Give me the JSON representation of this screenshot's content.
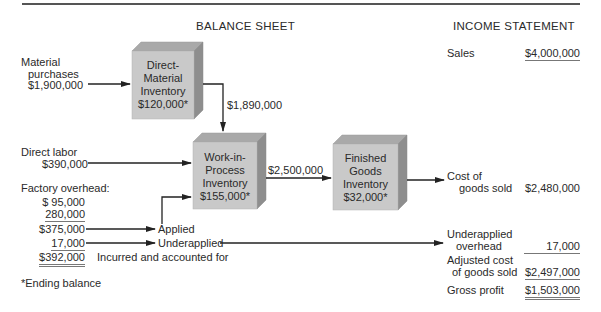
{
  "headers": {
    "balance_sheet": "BALANCE SHEET",
    "income_statement": "INCOME STATEMENT"
  },
  "inputs": {
    "material_purchases_label_1": "Material",
    "material_purchases_label_2": "purchases",
    "material_purchases_amount": "$1,900,000",
    "direct_labor_label": "Direct labor",
    "direct_labor_amount": "$390,000",
    "factory_overhead_label": "Factory overhead:",
    "overhead_lines": [
      "$  95,000",
      "280,000",
      "$375,000",
      "17,000",
      "$392,000"
    ],
    "applied_label": "Applied",
    "underapplied_label": "Underapplied",
    "incurred_label": "Incurred and accounted for"
  },
  "boxes": {
    "direct_material": {
      "lines": [
        "Direct-",
        "Material",
        "Inventory",
        "$120,000*"
      ]
    },
    "work_in_process": {
      "lines": [
        "Work-in-",
        "Process",
        "Inventory",
        "$155,000*"
      ]
    },
    "finished_goods": {
      "lines": [
        "Finished",
        "Goods",
        "Inventory",
        "$32,000*"
      ]
    }
  },
  "flows": {
    "dm_to_wip": "$1,890,000",
    "wip_to_fg": "$2,500,000"
  },
  "income_statement": {
    "sales_label": "Sales",
    "sales_amount": "$4,000,000",
    "cogs_label_1": "Cost of",
    "cogs_label_2": "goods sold",
    "cogs_amount": "$2,480,000",
    "underapplied_label_1": "Underapplied",
    "underapplied_label_2": "overhead",
    "underapplied_amount": "17,000",
    "adjusted_label_1": "Adjusted cost",
    "adjusted_label_2": "of goods sold",
    "adjusted_amount": "$2,497,000",
    "gross_profit_label": "Gross profit",
    "gross_profit_amount": "$1,503,000"
  },
  "footnote": "*Ending balance",
  "colors": {
    "box_front": "#c9c9c9",
    "box_top": "#a9a9a9",
    "box_side": "#8e8e8e",
    "line": "#222222"
  }
}
